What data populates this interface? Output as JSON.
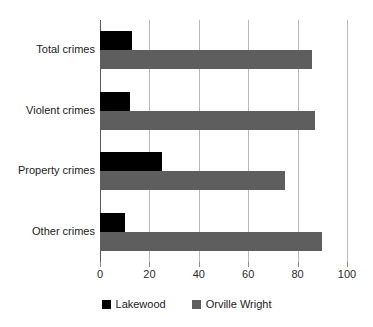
{
  "chart_data": {
    "type": "bar",
    "orientation": "horizontal",
    "title": "",
    "xlabel": "",
    "ylabel": "",
    "categories": [
      "Total crimes",
      "Violent crimes",
      "Property crimes",
      "Other crimes"
    ],
    "series": [
      {
        "name": "Lakewood",
        "color": "#000000",
        "values": [
          13,
          12,
          25,
          10
        ]
      },
      {
        "name": "Orville Wright",
        "color": "#5e5e5e",
        "values": [
          86,
          87,
          75,
          90
        ]
      }
    ],
    "xlim": [
      0,
      100
    ],
    "xticks": [
      0,
      20,
      40,
      60,
      80,
      100
    ],
    "xtick_labels": [
      "0",
      "20",
      "40",
      "60",
      "80",
      "100"
    ],
    "grid": true,
    "grid_axis": "x",
    "legend_position": "bottom"
  },
  "legend": {
    "items": [
      {
        "label": "Lakewood",
        "color": "#000000"
      },
      {
        "label": "Orville Wright",
        "color": "#5e5e5e"
      }
    ]
  }
}
